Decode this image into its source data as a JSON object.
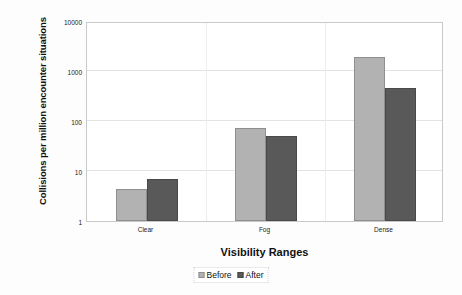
{
  "chart_data": {
    "type": "bar",
    "title": "",
    "xlabel": "Visibility Ranges",
    "ylabel": "Collisions per million encounter situations",
    "categories": [
      "Clear",
      "Fog",
      "Dense"
    ],
    "series": [
      {
        "name": "Before",
        "color": "#b2b2b2",
        "values": [
          4.3,
          72,
          1900
        ]
      },
      {
        "name": "After",
        "color": "#595959",
        "values": [
          7,
          50,
          450
        ]
      }
    ],
    "yscale": "log",
    "ylim": [
      1,
      10000
    ],
    "yticks": [
      1,
      10,
      100,
      1000,
      10000
    ],
    "ytick_labels": [
      "1",
      "10",
      "100",
      "1000",
      "10000"
    ],
    "grid": true,
    "legend_position": "bottom"
  },
  "axes": {
    "y_title": "Collisions per million encounter situations",
    "x_title": "Visibility Ranges"
  },
  "legend": {
    "entries": [
      {
        "label": "Before"
      },
      {
        "label": "After"
      }
    ]
  }
}
